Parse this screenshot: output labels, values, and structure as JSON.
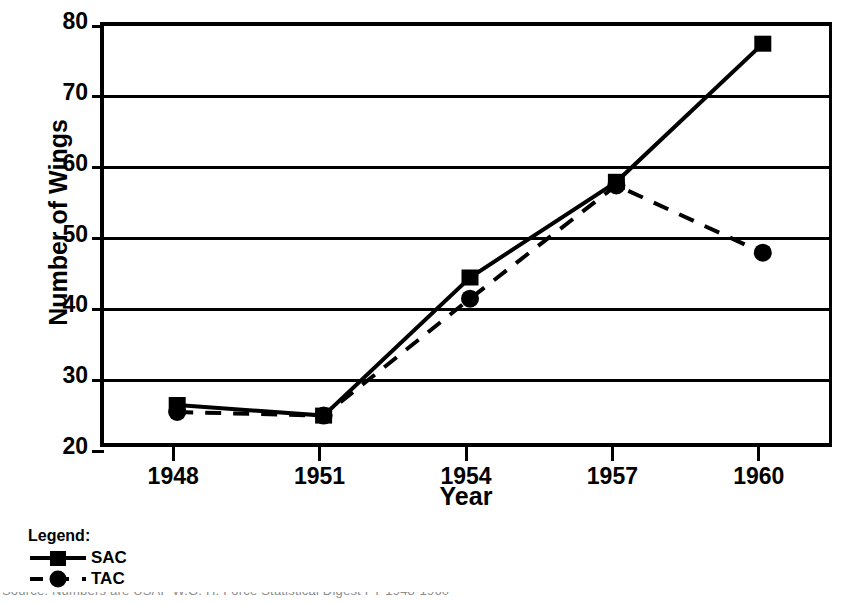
{
  "chart_data": {
    "type": "line",
    "title": "",
    "xlabel": "Year",
    "ylabel": "Number of Wings",
    "categories": [
      "1948",
      "1951",
      "1954",
      "1957",
      "1960"
    ],
    "x": [
      1948,
      1951,
      1954,
      1957,
      1960
    ],
    "xlim": [
      1946.5,
      1961.5
    ],
    "ylim": [
      20,
      80
    ],
    "yticks": [
      20,
      30,
      40,
      50,
      60,
      70,
      80
    ],
    "ytick_labels": [
      "20",
      "30",
      "40",
      "50",
      "60",
      "70",
      "80"
    ],
    "grid": "horizontal",
    "legend_position": "below-left",
    "legend_title": "Legend:",
    "series": [
      {
        "name": "SAC",
        "values": [
          26.5,
          25.0,
          44.5,
          58.0,
          77.5
        ],
        "line_style": "solid",
        "marker": "square",
        "color": "#000000"
      },
      {
        "name": "TAC",
        "values": [
          25.5,
          25.0,
          41.5,
          57.5,
          48.0
        ],
        "line_style": "dashed",
        "marker": "circle",
        "color": "#000000"
      }
    ]
  },
  "axes": {
    "y_title": "Number of Wings",
    "x_title": "Year"
  },
  "legend": {
    "title": "Legend:",
    "entries": [
      {
        "label": "SAC",
        "marker": "square",
        "line_style": "solid"
      },
      {
        "label": "TAC",
        "marker": "circle",
        "line_style": "dashed"
      }
    ]
  },
  "caption": {
    "text": "Source: Numbers are USAF W.G. H. Force Statistical Digest FY 1948-1960"
  },
  "colors": {
    "ink": "#000000",
    "background": "#ffffff"
  }
}
